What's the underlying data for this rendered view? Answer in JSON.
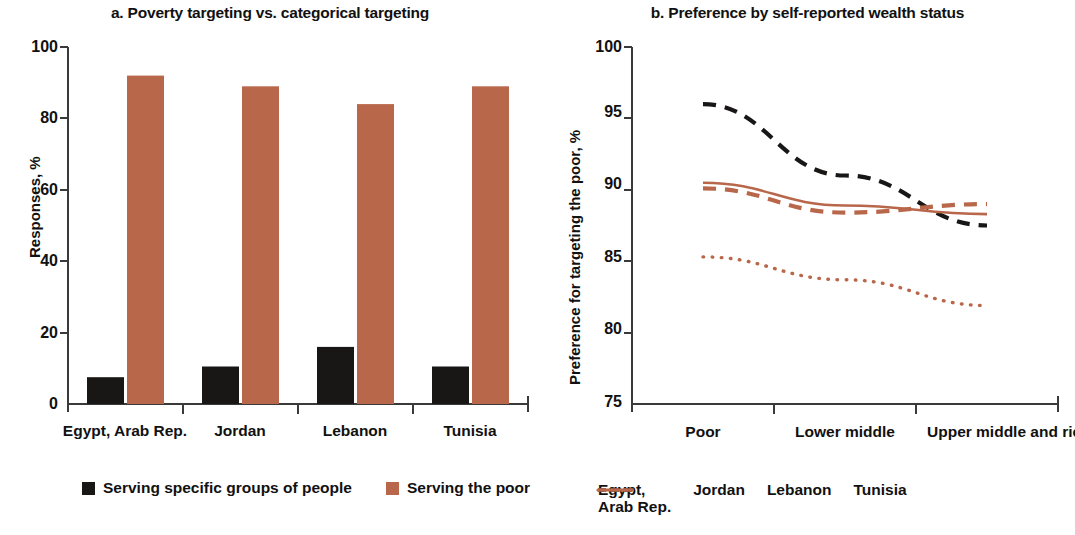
{
  "figure": {
    "colors": {
      "black": "#191716",
      "terracotta": "#B8674A",
      "axis": "#3a3a3a",
      "background": "#FFFFFF"
    }
  },
  "panel_a": {
    "title": "a. Poverty targeting vs. categorical targeting",
    "legend": [
      {
        "label": "Serving specific groups of people",
        "swatch": "#191716",
        "marker": "square-swatch"
      },
      {
        "label": "Serving the poor",
        "swatch": "#B8674A",
        "marker": "square-swatch"
      }
    ]
  },
  "panel_b": {
    "title": "b. Preference by self-reported wealth status",
    "legend": [
      {
        "label": "Egypt,\nArab Rep.",
        "color": "#191716",
        "style": "dashed",
        "marker": "dashed-line-black"
      },
      {
        "label": "Jordan",
        "color": "#B8674A",
        "style": "solid",
        "marker": "solid-line-terracotta"
      },
      {
        "label": "Lebanon",
        "color": "#B8674A",
        "style": "dotted",
        "marker": "dotted-line-terracotta"
      },
      {
        "label": "Tunisia",
        "color": "#B8674A",
        "style": "dashed",
        "marker": "dashed-line-terracotta"
      }
    ]
  },
  "chart_data": [
    {
      "id": "panel-a",
      "type": "bar",
      "title": "a. Poverty targeting vs. categorical targeting",
      "xlabel": "",
      "ylabel": "Responses, %",
      "ylim": [
        0,
        100
      ],
      "yticks": [
        0,
        20,
        40,
        60,
        80,
        100
      ],
      "ytick_labels": [
        "0",
        "20",
        "40",
        "60",
        "80",
        "100"
      ],
      "grid": false,
      "legend_position": "bottom",
      "categories": [
        "Egypt, Arab Rep.",
        "Jordan",
        "Lebanon",
        "Tunisia"
      ],
      "series": [
        {
          "name": "Serving specific groups of people",
          "color": "#191716",
          "values": [
            7.5,
            10.5,
            16,
            10.5
          ]
        },
        {
          "name": "Serving the poor",
          "color": "#B8674A",
          "values": [
            92,
            89,
            84,
            89
          ]
        }
      ]
    },
    {
      "id": "panel-b",
      "type": "line",
      "title": "b. Preference by self-reported wealth status",
      "xlabel": "",
      "ylabel": "Preference for targeting the poor, %",
      "ylim": [
        75,
        100
      ],
      "yticks": [
        75,
        80,
        85,
        90,
        95,
        100
      ],
      "ytick_labels": [
        "75",
        "80",
        "85",
        "90",
        "95",
        "100"
      ],
      "grid": false,
      "legend_position": "bottom",
      "x": [
        "Poor",
        "Lower middle",
        "Upper middle and rich"
      ],
      "series": [
        {
          "name": "Egypt, Arab Rep.",
          "color": "#191716",
          "style": "dashed",
          "values": [
            96.0,
            91.0,
            87.5
          ]
        },
        {
          "name": "Jordan",
          "color": "#B8674A",
          "style": "solid",
          "values": [
            90.5,
            88.9,
            88.3
          ]
        },
        {
          "name": "Lebanon",
          "color": "#B8674A",
          "style": "dotted",
          "values": [
            85.3,
            83.7,
            81.9
          ]
        },
        {
          "name": "Tunisia",
          "color": "#B8674A",
          "style": "dashed",
          "values": [
            90.1,
            88.4,
            89.0
          ]
        }
      ]
    }
  ]
}
